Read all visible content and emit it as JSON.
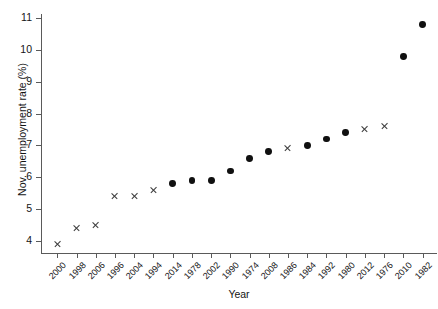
{
  "chart_data": {
    "type": "scatter",
    "title": "",
    "xlabel": "Year",
    "ylabel": "Nov. unemployment rate (%)",
    "categories": [
      "2000",
      "1998",
      "2006",
      "1996",
      "2004",
      "1994",
      "2014",
      "1978",
      "2002",
      "1990",
      "1974",
      "2008",
      "1986",
      "1984",
      "1992",
      "1980",
      "2012",
      "1976",
      "2010",
      "1982"
    ],
    "values": [
      3.9,
      4.4,
      4.5,
      5.4,
      5.4,
      5.6,
      5.8,
      5.9,
      5.9,
      6.2,
      6.6,
      6.8,
      6.9,
      7.0,
      7.2,
      7.4,
      7.5,
      7.6,
      9.8,
      10.8
    ],
    "markers": [
      "cross",
      "cross",
      "cross",
      "cross",
      "cross",
      "cross",
      "dot",
      "dot",
      "dot",
      "dot",
      "dot",
      "dot",
      "cross",
      "dot",
      "dot",
      "dot",
      "cross",
      "cross",
      "dot",
      "dot"
    ],
    "ylim": [
      3.6,
      11.2
    ],
    "yticks": [
      4,
      5,
      6,
      7,
      8,
      9,
      10,
      11
    ],
    "ytick_labels": [
      "4",
      "5",
      "6",
      "7",
      "8",
      "9",
      "10",
      "11"
    ],
    "grid": false,
    "legend": "none",
    "marker_color": "#101010",
    "axis_color": "#5a5a5a"
  }
}
